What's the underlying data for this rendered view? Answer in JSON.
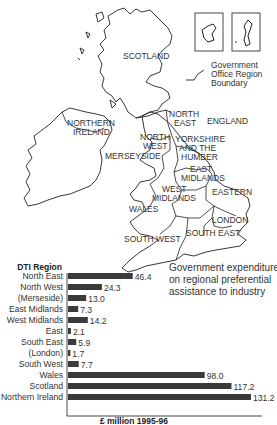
{
  "map": {
    "labels": {
      "scotland": "SCOTLAND",
      "northern_ireland": [
        "NORTHERN",
        "IRELAND"
      ],
      "north_east": [
        "NORTH",
        "EAST"
      ],
      "england": "ENGLAND",
      "north_west": [
        "NORTH",
        "WEST"
      ],
      "yorkshire": [
        "YORKSHIRE",
        "AND THE",
        "HUMBER"
      ],
      "merseyside": "MERSEYSIDE",
      "east_midlands": [
        "EAST",
        "MIDLANDS"
      ],
      "west_midlands": [
        "WEST",
        "MIDLANDS"
      ],
      "eastern": "EASTERN",
      "wales": "WALES",
      "london": "LONDON",
      "south_east": "SOUTH EAST",
      "south_west": "SOUTH WEST"
    },
    "legend": [
      "Government",
      "Office Region",
      "Boundary"
    ]
  },
  "chart_data": {
    "type": "bar",
    "orientation": "horizontal",
    "title": [
      "Government expenditure",
      "on regional preferential",
      "assistance to industry"
    ],
    "ylabel": "DTI Region",
    "xlabel": "£ million 1995-96",
    "categories": [
      "North East",
      "North West",
      "(Merseside)",
      "East Midlands",
      "West Midlands",
      "East",
      "South East",
      "(London)",
      "South West",
      "Wales",
      "Scotland",
      "Northern Ireland"
    ],
    "values": [
      46.4,
      24.3,
      13.0,
      7.3,
      14.2,
      2.1,
      5.9,
      1.7,
      7.7,
      98.0,
      117.2,
      131.2
    ],
    "value_labels": [
      "46.4",
      "24.3",
      "13.0",
      "7.3",
      "14.2",
      "2.1",
      "5.9",
      "1.7",
      "7.7",
      "98.0",
      "117.2",
      "131.2"
    ],
    "xlim": [
      0,
      131.2
    ],
    "grid": false,
    "bar_color": "#3a3a3a"
  }
}
